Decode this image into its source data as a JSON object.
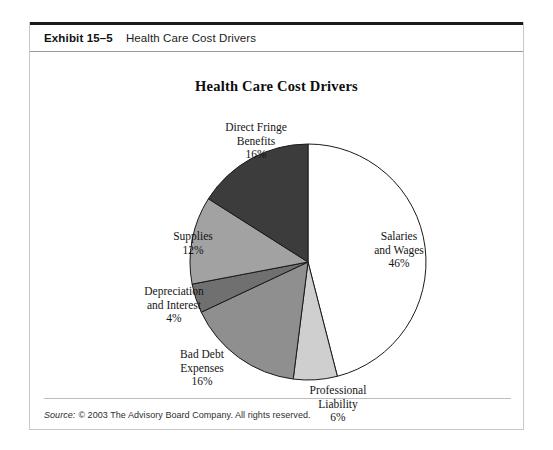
{
  "exhibit": {
    "number": "Exhibit 15–5",
    "header_title": "Health Care Cost Drivers"
  },
  "source": {
    "label": "Source:",
    "text": "© 2003 The Advisory Board Company. All rights reserved."
  },
  "chart_data": {
    "type": "pie",
    "title": "Health Care Cost Drivers",
    "xlabel": "",
    "ylabel": "",
    "legend": "none",
    "start_angle_deg": 0,
    "direction": "clockwise",
    "unit": "%",
    "categories": [
      "Salaries and Wages",
      "Professional Liability",
      "Bad Debt Expenses",
      "Depreciation and Interest",
      "Supplies",
      "Direct Fringe Benefits"
    ],
    "values": [
      46,
      6,
      16,
      4,
      12,
      16
    ],
    "colors": [
      "#ffffff",
      "#cfcfcf",
      "#8f8f8f",
      "#707070",
      "#a2a2a2",
      "#3c3c3c"
    ],
    "slices": [
      {
        "name": "Salaries and Wages",
        "value": 46,
        "label_line1": "Salaries",
        "label_line2": "and Wages",
        "label_pct": "46%",
        "color": "#ffffff"
      },
      {
        "name": "Professional Liability",
        "value": 6,
        "label_line1": "Professional",
        "label_line2": "Liability",
        "label_pct": "6%",
        "color": "#cfcfcf"
      },
      {
        "name": "Bad Debt Expenses",
        "value": 16,
        "label_line1": "Bad Debt",
        "label_line2": "Expenses",
        "label_pct": "16%",
        "color": "#8f8f8f"
      },
      {
        "name": "Depreciation and Interest",
        "value": 4,
        "label_line1": "Depreciation",
        "label_line2": "and Interest",
        "label_pct": "4%",
        "color": "#707070"
      },
      {
        "name": "Supplies",
        "value": 12,
        "label_line1": "Supplies",
        "label_line2": "",
        "label_pct": "12%",
        "color": "#a2a2a2"
      },
      {
        "name": "Direct Fringe Benefits",
        "value": 16,
        "label_line1": "Direct Fringe",
        "label_line2": "Benefits",
        "label_pct": "16%",
        "color": "#3c3c3c"
      }
    ]
  }
}
